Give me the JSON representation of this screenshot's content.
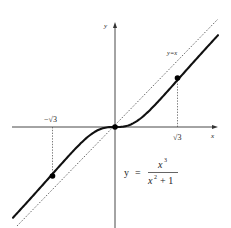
{
  "figure": {
    "axes": {
      "x_label": "x",
      "y_label": "y"
    },
    "asymptote_label": "y=x",
    "ticks": {
      "neg_sqrt3": "−√3",
      "pos_sqrt3": "√3"
    },
    "formula": {
      "lhs": "y",
      "equals": "=",
      "numerator": "x",
      "numerator_exp": "3",
      "denominator_base": "x",
      "denominator_exp": "2",
      "denominator_rest": "+ 1"
    },
    "points": [
      {
        "name": "inflection-left",
        "x": "-√3",
        "y": "-3√3/4"
      },
      {
        "name": "origin",
        "x": "0",
        "y": "0"
      },
      {
        "name": "inflection-right",
        "x": "√3",
        "y": "3√3/4"
      }
    ],
    "colors": {
      "curve": "#111111",
      "axis": "#333333",
      "dashed": "#444444"
    }
  }
}
